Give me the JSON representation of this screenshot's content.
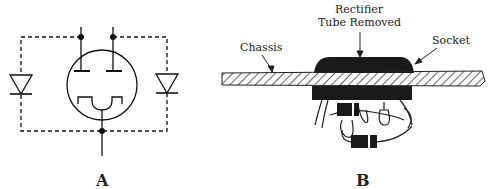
{
  "figure": {
    "panel_a": {
      "label": "A",
      "description": "Full-wave rectifier tube schematic with two solid-state diodes wired in dashed lines as replacement"
    },
    "panel_b": {
      "label": "B",
      "callouts": {
        "chassis": "Chassis",
        "tube_line1": "Rectifier",
        "tube_line2": "Tube Removed",
        "socket": "Socket"
      }
    }
  }
}
